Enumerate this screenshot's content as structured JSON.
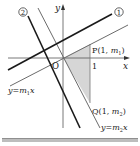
{
  "diagram": {
    "axes": {
      "x_label": "x",
      "y_label": "y",
      "origin_label": "O",
      "tick_x_label": "1"
    },
    "lines": [
      {
        "id": "line1",
        "label": "①",
        "style": "thick",
        "color": "#1a1a1a"
      },
      {
        "id": "line2",
        "label": "②",
        "style": "thick",
        "color": "#1a1a1a"
      },
      {
        "id": "y_m1x",
        "label_parts": [
          "y",
          "=",
          "m",
          "1",
          "x"
        ],
        "style": "thin",
        "color": "#6b6b6b"
      },
      {
        "id": "y_m2x",
        "label_parts": [
          "y",
          "=",
          "m",
          "2",
          "x"
        ],
        "style": "thin",
        "color": "#6b6b6b"
      }
    ],
    "points": {
      "P": {
        "name": "P",
        "coords_prefix": "(1, ",
        "var": "m",
        "sub": "1",
        "suffix": ")"
      },
      "Q": {
        "name": "Q",
        "coords_prefix": "(1, ",
        "var": "m",
        "sub": "2",
        "suffix": ")"
      }
    },
    "shaded_region": {
      "vertices": [
        "O",
        "P",
        "Q"
      ],
      "color": "#d9d9d9"
    }
  }
}
